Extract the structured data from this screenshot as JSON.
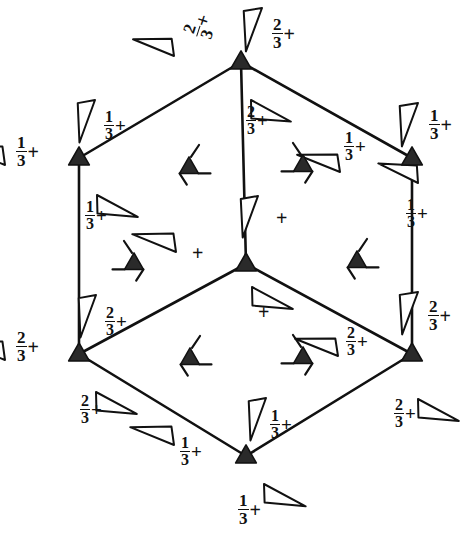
{
  "figure": {
    "kind": "crystallographic-space-group-symmetry-diagram",
    "cell_shape": "hexagonal",
    "background_color": "#ffffff",
    "ink_color": "#111111"
  },
  "cell_outline": {
    "name": "hexagonal-cell-outline",
    "vertices": [
      {
        "id": "top",
        "x": 241,
        "y": 62,
        "label": "top-vertex"
      },
      {
        "id": "upper-right",
        "x": 412,
        "y": 158,
        "label": "upper-right-vertex"
      },
      {
        "id": "lower-right",
        "x": 412,
        "y": 354,
        "label": "lower-right-vertex"
      },
      {
        "id": "bottom",
        "x": 246,
        "y": 456,
        "label": "bottom-vertex"
      },
      {
        "id": "lower-left",
        "x": 79,
        "y": 354,
        "label": "lower-left-vertex"
      },
      {
        "id": "upper-left",
        "x": 79,
        "y": 158,
        "label": "upper-left-vertex"
      }
    ],
    "center": {
      "id": "center",
      "x": 246,
      "y": 264,
      "label": "center-vertex"
    },
    "spokes": [
      {
        "from": "top",
        "to": "center"
      },
      {
        "from": "lower-left",
        "to": "center"
      },
      {
        "from": "lower-right",
        "to": "center"
      }
    ],
    "left_edge": {
      "from": "upper-left",
      "to": "lower-left"
    },
    "right_edge": {
      "from": "upper-right",
      "to": "lower-right"
    }
  },
  "axis_symbols": {
    "three_fold_filled_triangles": [
      {
        "name": "three-fold-axis-top",
        "x": 241,
        "y": 62
      },
      {
        "name": "three-fold-axis-upper-right",
        "x": 412,
        "y": 158
      },
      {
        "name": "three-fold-axis-lower-right",
        "x": 412,
        "y": 354
      },
      {
        "name": "three-fold-axis-bottom",
        "x": 246,
        "y": 456
      },
      {
        "name": "three-fold-axis-lower-left",
        "x": 79,
        "y": 354
      },
      {
        "name": "three-fold-axis-upper-left",
        "x": 79,
        "y": 158
      },
      {
        "name": "three-fold-axis-center",
        "x": 246,
        "y": 264
      }
    ],
    "three_fold_screw_axes": [
      {
        "name": "screw-axis-upper-inner-left",
        "x": 189,
        "y": 167,
        "hand": "left"
      },
      {
        "name": "screw-axis-upper-inner-right",
        "x": 303,
        "y": 165,
        "hand": "right"
      },
      {
        "name": "screw-axis-mid-left",
        "x": 134,
        "y": 263,
        "hand": "right"
      },
      {
        "name": "screw-axis-mid-right",
        "x": 357,
        "y": 261,
        "hand": "left"
      },
      {
        "name": "screw-axis-lower-inner-left",
        "x": 190,
        "y": 358,
        "hand": "left"
      },
      {
        "name": "screw-axis-lower-inner-right",
        "x": 303,
        "y": 357,
        "hand": "right"
      }
    ]
  },
  "two_fold_arrow_symbols": [
    {
      "name": "two-fold-axis-arrow-top-outer",
      "x": 262,
      "y": 8,
      "rotation": 104,
      "length": 46,
      "width": 17
    },
    {
      "name": "two-fold-axis-arrow-top-left",
      "x": 174,
      "y": 56,
      "rotation": 196,
      "length": 44,
      "width": 16
    },
    {
      "name": "two-fold-axis-arrow-upper-left-edge",
      "x": 95,
      "y": 100,
      "rotation": 104,
      "length": 45,
      "width": 16
    },
    {
      "name": "two-fold-axis-arrow-left-outer",
      "x": 5,
      "y": 165,
      "rotation": 196,
      "length": 47,
      "width": 17
    },
    {
      "name": "two-fold-axis-arrow-center-top",
      "x": 251,
      "y": 100,
      "rotation": 22,
      "length": 45,
      "width": 17
    },
    {
      "name": "two-fold-axis-arrow-upper-right-edge",
      "x": 340,
      "y": 172,
      "rotation": 196,
      "length": 46,
      "width": 16
    },
    {
      "name": "two-fold-axis-arrow-right-outer-top",
      "x": 418,
      "y": 103,
      "rotation": 104,
      "length": 46,
      "width": 17
    },
    {
      "name": "two-fold-axis-arrow-left-edge-mid",
      "x": 97,
      "y": 195,
      "rotation": 22,
      "length": 46,
      "width": 17
    },
    {
      "name": "two-fold-axis-arrow-right-edge-mid",
      "x": 418,
      "y": 183,
      "rotation": 200,
      "length": 44,
      "width": 16
    },
    {
      "name": "two-fold-axis-arrow-center-mid",
      "x": 258,
      "y": 196,
      "rotation": 104,
      "length": 44,
      "width": 16
    },
    {
      "name": "two-fold-axis-arrow-center-left",
      "x": 176,
      "y": 252,
      "rotation": 196,
      "length": 47,
      "width": 17
    },
    {
      "name": "two-fold-axis-arrow-left-lower-edge",
      "x": 96,
      "y": 295,
      "rotation": 104,
      "length": 45,
      "width": 16
    },
    {
      "name": "two-fold-axis-arrow-center-lower",
      "x": 252,
      "y": 287,
      "rotation": 22,
      "length": 46,
      "width": 17
    },
    {
      "name": "two-fold-axis-arrow-right-lower-edge",
      "x": 418,
      "y": 292,
      "rotation": 104,
      "length": 45,
      "width": 17
    },
    {
      "name": "two-fold-axis-arrow-left-outer-lower",
      "x": 5,
      "y": 360,
      "rotation": 196,
      "length": 47,
      "width": 17
    },
    {
      "name": "two-fold-axis-arrow-lower-right-edge",
      "x": 338,
      "y": 356,
      "rotation": 196,
      "length": 46,
      "width": 16
    },
    {
      "name": "two-fold-axis-arrow-lower-left-edge",
      "x": 96,
      "y": 392,
      "rotation": 22,
      "length": 46,
      "width": 17
    },
    {
      "name": "two-fold-axis-arrow-right-outer-low",
      "x": 418,
      "y": 399,
      "rotation": 22,
      "length": 46,
      "width": 17
    },
    {
      "name": "two-fold-axis-arrow-bottom-center",
      "x": 266,
      "y": 398,
      "rotation": 104,
      "length": 45,
      "width": 16
    },
    {
      "name": "two-fold-axis-arrow-bottom-left",
      "x": 174,
      "y": 445,
      "rotation": 196,
      "length": 47,
      "width": 17
    },
    {
      "name": "two-fold-axis-arrow-bottom-outer",
      "x": 264,
      "y": 484,
      "rotation": 22,
      "length": 47,
      "width": 17
    }
  ],
  "height_labels": [
    {
      "name": "height-label-top-outer",
      "numerator": "2",
      "denominator": "3",
      "sign": "+",
      "x": 272,
      "y": 16,
      "rotation": 0,
      "size": 17
    },
    {
      "name": "height-label-top-left",
      "numerator": "2",
      "denominator": "3",
      "sign": "+",
      "x": 180,
      "y": 31,
      "rotation": -72,
      "size": 17
    },
    {
      "name": "height-label-upper-left-edge",
      "numerator": "1",
      "denominator": "3",
      "sign": "+",
      "x": 104,
      "y": 109,
      "rotation": 0,
      "size": 16
    },
    {
      "name": "height-label-left-outer",
      "numerator": "1",
      "denominator": "3",
      "sign": "+",
      "x": 16,
      "y": 134,
      "rotation": 0,
      "size": 17
    },
    {
      "name": "height-label-center-upper",
      "numerator": "2",
      "denominator": "3",
      "sign": "+",
      "x": 246,
      "y": 104,
      "rotation": 0,
      "size": 16
    },
    {
      "name": "height-label-upper-right-edge",
      "numerator": "1",
      "denominator": "3",
      "sign": "+",
      "x": 344,
      "y": 130,
      "rotation": 0,
      "size": 16
    },
    {
      "name": "height-label-right-outer-top",
      "numerator": "1",
      "denominator": "3",
      "sign": "+",
      "x": 429,
      "y": 107,
      "rotation": 0,
      "size": 17
    },
    {
      "name": "height-label-left-edge-mid",
      "numerator": "1",
      "denominator": "3",
      "sign": "+",
      "x": 85,
      "y": 199,
      "rotation": 0,
      "size": 16
    },
    {
      "name": "height-label-right-edge-mid",
      "numerator": "1",
      "denominator": "3",
      "sign": "+",
      "x": 406,
      "y": 197,
      "rotation": 0,
      "size": 16
    },
    {
      "name": "height-label-center-mid",
      "numerator": "",
      "denominator": "",
      "sign": "+",
      "x": 276,
      "y": 208,
      "rotation": 0,
      "size": 17
    },
    {
      "name": "height-label-center-left",
      "numerator": "",
      "denominator": "",
      "sign": "+",
      "x": 192,
      "y": 243,
      "rotation": 0,
      "size": 17
    },
    {
      "name": "height-label-left-lower-edge",
      "numerator": "2",
      "denominator": "3",
      "sign": "+",
      "x": 105,
      "y": 305,
      "rotation": 0,
      "size": 16
    },
    {
      "name": "height-label-center-lower",
      "numerator": "",
      "denominator": "",
      "sign": "+",
      "x": 258,
      "y": 302,
      "rotation": 0,
      "size": 17
    },
    {
      "name": "height-label-right-lower-edge",
      "numerator": "2",
      "denominator": "3",
      "sign": "+",
      "x": 428,
      "y": 298,
      "rotation": 0,
      "size": 17
    },
    {
      "name": "height-label-left-outer-lower",
      "numerator": "2",
      "denominator": "3",
      "sign": "+",
      "x": 16,
      "y": 329,
      "rotation": 0,
      "size": 17
    },
    {
      "name": "height-label-lower-right-edge",
      "numerator": "2",
      "denominator": "3",
      "sign": "+",
      "x": 346,
      "y": 325,
      "rotation": 0,
      "size": 16
    },
    {
      "name": "height-label-lower-left-edge",
      "numerator": "2",
      "denominator": "3",
      "sign": "+",
      "x": 80,
      "y": 393,
      "rotation": 0,
      "size": 16
    },
    {
      "name": "height-label-right-outer-low",
      "numerator": "2",
      "denominator": "3",
      "sign": "+",
      "x": 394,
      "y": 397,
      "rotation": 0,
      "size": 16
    },
    {
      "name": "height-label-bottom-center",
      "numerator": "1",
      "denominator": "3",
      "sign": "+",
      "x": 270,
      "y": 408,
      "rotation": 0,
      "size": 16
    },
    {
      "name": "height-label-bottom-left",
      "numerator": "1",
      "denominator": "3",
      "sign": "+",
      "x": 180,
      "y": 435,
      "rotation": 0,
      "size": 16
    },
    {
      "name": "height-label-bottom-outer",
      "numerator": "1",
      "denominator": "3",
      "sign": "+",
      "x": 238,
      "y": 492,
      "rotation": 0,
      "size": 17
    }
  ]
}
